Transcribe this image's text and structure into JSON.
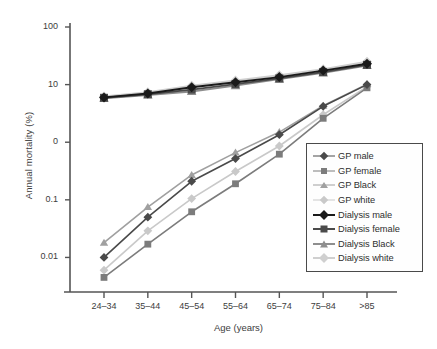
{
  "chart_data": {
    "type": "line",
    "title": "",
    "xlabel": "Age (years)",
    "ylabel": "Annual mortality (%)",
    "categories": [
      "24–34",
      "35–44",
      "45–54",
      "55–64",
      "65–74",
      "75–84",
      ">85"
    ],
    "yscale": "log",
    "ylim": [
      0.002,
      100
    ],
    "ytick_labels": [
      "100",
      "10",
      "0",
      "0.1",
      "0.01"
    ],
    "ytick_values": [
      100,
      10,
      1,
      0.1,
      0.01
    ],
    "grid": false,
    "legend_position": "bottom-right",
    "series": [
      {
        "name": "GP male",
        "color": "#4a4a4a",
        "marker": "diamond",
        "values": [
          0.01,
          0.05,
          0.21,
          0.52,
          1.35,
          4.2,
          10.0
        ]
      },
      {
        "name": "GP female",
        "color": "#7c7c7c",
        "marker": "square",
        "values": [
          0.0045,
          0.017,
          0.062,
          0.19,
          0.62,
          2.6,
          8.8
        ]
      },
      {
        "name": "GP Black",
        "color": "#a0a0a0",
        "marker": "triangle",
        "values": [
          0.018,
          0.075,
          0.27,
          0.66,
          1.5,
          4.3,
          10.2
        ]
      },
      {
        "name": "GP white",
        "color": "#c9c9c9",
        "marker": "diamond",
        "values": [
          0.006,
          0.029,
          0.105,
          0.31,
          0.86,
          3.0,
          9.2
        ]
      },
      {
        "name": "Dialysis male",
        "color": "#1a1a1a",
        "marker": "diamond",
        "values": [
          6.0,
          7.0,
          9.0,
          11.0,
          13.5,
          17.5,
          23.0
        ]
      },
      {
        "name": "Dialysis female",
        "color": "#4a4a4a",
        "marker": "square",
        "values": [
          5.9,
          6.8,
          8.2,
          10.2,
          12.8,
          16.5,
          22.0
        ]
      },
      {
        "name": "Dialysis Black",
        "color": "#8e8e8e",
        "marker": "triangle",
        "values": [
          5.8,
          6.6,
          7.6,
          9.6,
          12.5,
          16.0,
          21.5
        ]
      },
      {
        "name": "Dialysis white",
        "color": "#cfcfcf",
        "marker": "diamond",
        "values": [
          6.2,
          7.4,
          9.6,
          11.8,
          14.5,
          18.5,
          25.0
        ]
      }
    ]
  },
  "axes": {
    "ylabel": "Annual mortality (%)",
    "xlabel": "Age (years)"
  }
}
